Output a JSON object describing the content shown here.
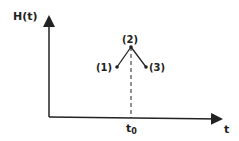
{
  "diagram": {
    "y_axis_label": "H(t)",
    "x_axis_label": "t",
    "x_tick_label_main": "t",
    "x_tick_label_sub": "0",
    "points": [
      {
        "label": "(1)",
        "x": 117,
        "y": 67
      },
      {
        "label": "(2)",
        "x": 131,
        "y": 47
      },
      {
        "label": "(3)",
        "x": 146,
        "y": 67
      }
    ],
    "line_color": "#222222"
  }
}
